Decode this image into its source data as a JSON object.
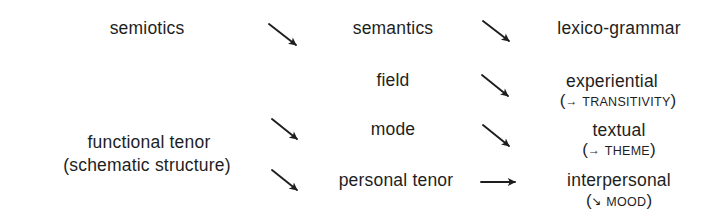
{
  "diagram": {
    "type": "stratification-mapping",
    "colors": {
      "text": "#1e1e1e",
      "arrow": "#1e1e1e",
      "background": "#ffffff"
    },
    "row_top": {
      "left": "semiotics",
      "middle": "semantics",
      "right": "lexico-grammar"
    },
    "left_group": {
      "line1": "functional tenor",
      "line2": "(schematic structure)"
    },
    "middle_column": [
      {
        "label": "field"
      },
      {
        "label": "mode"
      },
      {
        "label": "personal tenor"
      }
    ],
    "right_column": [
      {
        "label": "experiential",
        "note_open": "(",
        "note_arrow": "→",
        "note_text": "TRANSITIVITY",
        "note_close": ")"
      },
      {
        "label": "textual",
        "note_open": "(",
        "note_arrow": "→",
        "note_text": "THEME",
        "note_close": ")"
      },
      {
        "label": "interpersonal",
        "note_open": "(",
        "note_arrow": "↘",
        "note_text": "MOOD",
        "note_close": ")"
      }
    ],
    "arrows": [
      {
        "from": "semiotics",
        "to": "semantics",
        "direction": "diagonal-down-right"
      },
      {
        "from": "semantics",
        "to": "lexico-grammar",
        "direction": "diagonal-down-right"
      },
      {
        "from": "field",
        "to": "experiential",
        "direction": "diagonal-down-right"
      },
      {
        "from": "functional tenor",
        "to": "mode",
        "direction": "diagonal-down-right"
      },
      {
        "from": "mode",
        "to": "textual",
        "direction": "diagonal-down-right"
      },
      {
        "from": "(schematic structure)",
        "to": "personal tenor",
        "direction": "diagonal-down-right"
      },
      {
        "from": "personal tenor",
        "to": "interpersonal",
        "direction": "horizontal-right"
      }
    ]
  }
}
